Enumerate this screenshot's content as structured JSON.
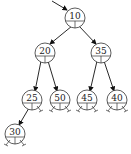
{
  "diagram": {
    "type": "binary-tree",
    "nodes": [
      {
        "id": "n10",
        "value": "10",
        "x": 75,
        "y": 18
      },
      {
        "id": "n20",
        "value": "20",
        "x": 45,
        "y": 53
      },
      {
        "id": "n35",
        "value": "35",
        "x": 101,
        "y": 53
      },
      {
        "id": "n25",
        "value": "25",
        "x": 32,
        "y": 100
      },
      {
        "id": "n50",
        "value": "50",
        "x": 60,
        "y": 100
      },
      {
        "id": "n45",
        "value": "45",
        "x": 87,
        "y": 100
      },
      {
        "id": "n40",
        "value": "40",
        "x": 117,
        "y": 100
      },
      {
        "id": "n30",
        "value": "30",
        "x": 15,
        "y": 134
      }
    ],
    "edges": [
      {
        "from": "root-pointer",
        "to": "n10"
      },
      {
        "from": "n10",
        "to": "n20"
      },
      {
        "from": "n10",
        "to": "n35"
      },
      {
        "from": "n20",
        "to": "n25"
      },
      {
        "from": "n20",
        "to": "n50"
      },
      {
        "from": "n35",
        "to": "n45"
      },
      {
        "from": "n35",
        "to": "n40"
      },
      {
        "from": "n25",
        "to": "n30"
      }
    ]
  }
}
